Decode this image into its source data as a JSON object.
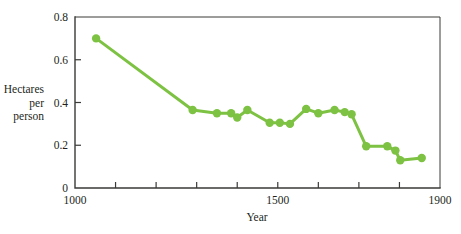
{
  "chart_data": {
    "type": "line",
    "title": "",
    "subtitle": "",
    "xlabel": "Year",
    "ylabel": "Hectares per person",
    "ylabel_lines": [
      "Hectares",
      "per",
      "person"
    ],
    "xlim": [
      1000,
      1900
    ],
    "ylim": [
      0,
      0.8
    ],
    "x_ticks": [
      1000,
      1100,
      1200,
      1300,
      1400,
      1500,
      1600,
      1700,
      1800,
      1900
    ],
    "x_tick_labels": [
      "1000",
      "",
      "",
      "",
      "",
      "1500",
      "",
      "",
      "",
      "1900"
    ],
    "y_ticks": [
      0,
      0.2,
      0.4,
      0.6,
      0.8
    ],
    "y_tick_labels": [
      "0",
      "0.2",
      "0.4",
      "0.6",
      "0.8"
    ],
    "grid": false,
    "legend": null,
    "marker": "circle",
    "series": [
      {
        "name": "Hectares per person",
        "color": "#7DC242",
        "x": [
          1052,
          1290,
          1350,
          1385,
          1400,
          1425,
          1480,
          1505,
          1530,
          1570,
          1600,
          1640,
          1665,
          1682,
          1718,
          1770,
          1790,
          1802,
          1855
        ],
        "values": [
          0.7,
          0.365,
          0.35,
          0.35,
          0.33,
          0.365,
          0.305,
          0.305,
          0.3,
          0.37,
          0.35,
          0.365,
          0.355,
          0.345,
          0.195,
          0.195,
          0.175,
          0.13,
          0.14
        ]
      }
    ],
    "colors": {
      "series": "#7DC242",
      "axis": "#3a3a38",
      "text": "#231f20",
      "background": "#ffffff"
    },
    "geometry": {
      "plot_left": 75,
      "plot_right": 440,
      "plot_top": 17,
      "plot_bottom": 188
    }
  }
}
